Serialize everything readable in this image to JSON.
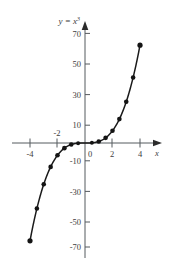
{
  "figure": {
    "title_parts": {
      "lhs": "y",
      "eq": " = ",
      "base": "x",
      "exp": "3"
    },
    "background_color": "#ffffff",
    "curve_color": "#1a1a1a",
    "axis_color": "#555a5e",
    "marker_color": "#141414"
  },
  "chart_data": {
    "type": "line",
    "xlabel": "x",
    "ylabel": "y",
    "xlim": [
      -4.6,
      4.9
    ],
    "ylim": [
      -76,
      78
    ],
    "grid": false,
    "legend": null,
    "x_ticks": [
      -4,
      -2,
      0,
      2,
      4
    ],
    "x_tick_labels": [
      "-4",
      "-2",
      "0",
      "2",
      "4"
    ],
    "y_ticks": [
      -70,
      -50,
      -30,
      -10,
      10,
      30,
      50,
      70
    ],
    "y_tick_labels": [
      "-70",
      "-50",
      "-30",
      "-10",
      "10",
      "30",
      "50",
      "70"
    ],
    "series": [
      {
        "name": "y = x³",
        "marker": "filled-circle",
        "x": [
          -4,
          -3.5,
          -3,
          -2.5,
          -2,
          -1.5,
          -1,
          -0.5,
          0,
          0.5,
          1,
          1.5,
          2,
          2.5,
          3,
          3.5,
          4
        ],
        "values": [
          -64,
          -42.875,
          -27,
          -15.625,
          -8,
          -3.375,
          -1,
          -0.125,
          0,
          0.125,
          1,
          3.375,
          8,
          15.625,
          27,
          42.875,
          64
        ]
      }
    ],
    "annotations": [
      {
        "text": "x",
        "role": "x-axis-name"
      },
      {
        "text": "y = x³",
        "role": "curve-label"
      }
    ]
  }
}
